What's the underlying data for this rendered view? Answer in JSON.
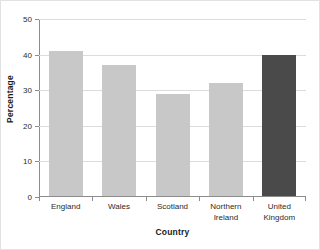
{
  "chart_data": {
    "type": "bar",
    "title": "",
    "categories": [
      "England",
      "Wales",
      "Scotland",
      "Northern Ireland",
      "United Kingdom"
    ],
    "category_lines": [
      [
        "England"
      ],
      [
        "Wales"
      ],
      [
        "Scotland"
      ],
      [
        "Northern",
        "Ireland"
      ],
      [
        "United",
        "Kingdom"
      ]
    ],
    "values": [
      41,
      37,
      29,
      32,
      40
    ],
    "xlabel": "Country",
    "ylabel": "Percentage",
    "ylim": [
      0,
      50
    ],
    "yticks": [
      0,
      10,
      20,
      30,
      40,
      50
    ],
    "ytick_labels": [
      "0",
      "10",
      "20",
      "30",
      "40",
      "50"
    ],
    "grid": "horizontal",
    "legend": "none",
    "bar_colors": [
      "#c8c8c8",
      "#c8c8c8",
      "#c8c8c8",
      "#c8c8c8",
      "#4a4a4a"
    ],
    "highlight_color": "#4a4a4a",
    "base_color": "#c8c8c8",
    "axis_color": "#8c8c8c",
    "grid_color": "#dcdcdc",
    "frame_color": "#e2e2e2",
    "background": "#ffffff"
  }
}
